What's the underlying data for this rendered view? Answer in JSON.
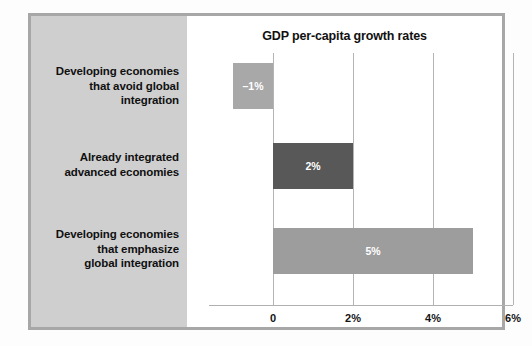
{
  "chart_data": {
    "type": "bar",
    "orientation": "horizontal",
    "title": "GDP per-capita growth rates",
    "xlabel": "",
    "ylabel": "",
    "categories": [
      "Developing economies that avoid global integration",
      "Already integrated advanced economies",
      "Developing economies that emphasize global integration"
    ],
    "values": [
      -1,
      2,
      5
    ],
    "value_labels": [
      "–1%",
      "2%",
      "5%"
    ],
    "xlim": [
      -1.4,
      6
    ],
    "xticks": [
      0,
      2,
      4,
      6
    ],
    "xtick_labels": [
      "0",
      "2%",
      "4%",
      "6%"
    ],
    "grid": "vertical",
    "legend": "none",
    "bar_colors": [
      "#a8a8a8",
      "#585858",
      "#9d9d9d"
    ]
  },
  "figure": {
    "title": "GDP per-capita growth rates",
    "panel_background": "#cfcfcf",
    "frame_color": "#a7a7a7",
    "gridline_color": "#b4b4b4",
    "value_label_color": "#ffffff"
  },
  "category_labels": [
    {
      "lines": [
        "Developing economies",
        "that avoid global",
        "integration"
      ],
      "full": "Developing economies that avoid global integration"
    },
    {
      "lines": [
        "Already integrated",
        "advanced economies"
      ],
      "full": "Already integrated advanced economies"
    },
    {
      "lines": [
        "Developing economies",
        "that emphasize",
        "global integration"
      ],
      "full": "Developing economies that emphasize global integration"
    }
  ],
  "axis": {
    "ticks": [
      {
        "label": "0",
        "value": 0
      },
      {
        "label": "2%",
        "value": 2
      },
      {
        "label": "4%",
        "value": 4
      },
      {
        "label": "6%",
        "value": 6
      }
    ]
  },
  "bars": [
    {
      "value_label": "–1%",
      "value": -1,
      "color": "#a8a8a8"
    },
    {
      "value_label": "2%",
      "value": 2,
      "color": "#585858"
    },
    {
      "value_label": "5%",
      "value": 5,
      "color": "#9d9d9d"
    }
  ]
}
